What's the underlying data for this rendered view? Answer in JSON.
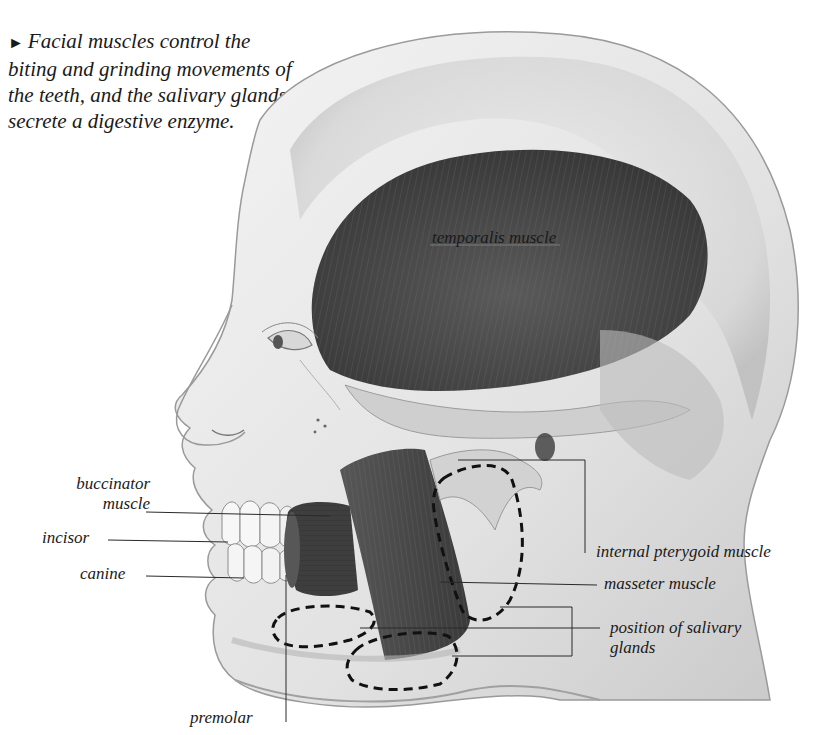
{
  "header": {
    "cropped_text": "· · · · · · · · · ·"
  },
  "caption": {
    "bullet": "►",
    "text": "Facial muscles control the biting and grinding movements of the teeth, and the salivary glands secrete a digestive enzyme."
  },
  "figure": {
    "labels": [
      {
        "id": "temporalis",
        "text": "temporalis muscle",
        "x": 432,
        "y": 228
      },
      {
        "id": "buccinator",
        "text": "buccinator muscle",
        "x": 78,
        "y": 472
      },
      {
        "id": "incisor",
        "text": "incisor",
        "x": 42,
        "y": 527
      },
      {
        "id": "canine",
        "text": "canine",
        "x": 80,
        "y": 563
      },
      {
        "id": "internal-pterygoid",
        "text": "internal pterygoid muscle",
        "x": 596,
        "y": 541
      },
      {
        "id": "masseter",
        "text": "masseter muscle",
        "x": 604,
        "y": 576
      },
      {
        "id": "salivary",
        "text": "position of salivary glands",
        "x": 610,
        "y": 618
      },
      {
        "id": "premolar",
        "text": "premolar",
        "x": 190,
        "y": 706
      }
    ],
    "colors": {
      "skin_light": "#f2f2f2",
      "skin_mid": "#d8d8d8",
      "skin_shadow": "#a9a9a9",
      "muscle": "#4a4a4a",
      "muscle_dark": "#353535",
      "tooth": "#f7f7f7",
      "leader_line": "#2a2a2a",
      "gland_outline": "#111111"
    }
  }
}
